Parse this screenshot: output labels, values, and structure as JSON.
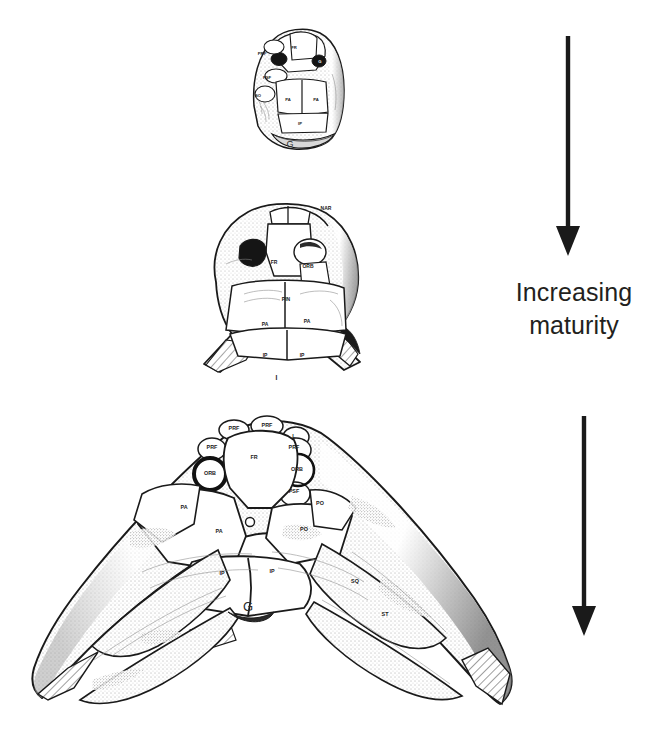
{
  "figure": {
    "background_color": "#ffffff",
    "ink_color": "#231f20",
    "line_color": "#1a1a1a"
  },
  "caption": {
    "line1": "Increasing",
    "line2": "maturity",
    "color": "#231f20"
  },
  "arrows": [
    {
      "name": "upper-arrow",
      "direction": "down",
      "color": "#1a1a1a"
    },
    {
      "name": "lower-arrow",
      "direction": "down",
      "color": "#1a1a1a"
    }
  ],
  "specimens": [
    {
      "id": "juvenile",
      "stage": "juvenile",
      "order": 1,
      "outline_labels": [
        "G"
      ],
      "plate_labels": [
        "PRF",
        "FR",
        "G",
        "PSF",
        "SO",
        "PA",
        "PA",
        "IP"
      ],
      "labels": [
        {
          "text": "PRF",
          "x": 30,
          "y": 40
        },
        {
          "text": "FR",
          "x": 62,
          "y": 34
        },
        {
          "text": "G",
          "x": 88,
          "y": 48
        },
        {
          "text": "PSF",
          "x": 35,
          "y": 64
        },
        {
          "text": "SO",
          "x": 26,
          "y": 82
        },
        {
          "text": "PA",
          "x": 56,
          "y": 86
        },
        {
          "text": "PA",
          "x": 84,
          "y": 86
        },
        {
          "text": "IP",
          "x": 68,
          "y": 110
        },
        {
          "text": "G",
          "x": 58,
          "y": 131
        }
      ]
    },
    {
      "id": "subadult",
      "stage": "sub-adult",
      "order": 2,
      "plate_labels": [
        "NAR",
        "FR",
        "ORB",
        "PIN",
        "PA",
        "PA",
        "IP",
        "IP",
        "L"
      ],
      "labels": [
        {
          "text": "NAR",
          "x": 166,
          "y": 19
        },
        {
          "text": "FR",
          "x": 114,
          "y": 73
        },
        {
          "text": "ORB",
          "x": 148,
          "y": 77
        },
        {
          "text": "PIN",
          "x": 126,
          "y": 110
        },
        {
          "text": "PA",
          "x": 105,
          "y": 135
        },
        {
          "text": "PA",
          "x": 147,
          "y": 132
        },
        {
          "text": "IP",
          "x": 105,
          "y": 166
        },
        {
          "text": "IP",
          "x": 142,
          "y": 166
        },
        {
          "text": "L",
          "x": 118,
          "y": 190
        }
      ]
    },
    {
      "id": "mature",
      "stage": "mature",
      "order": 3,
      "plate_labels": [
        "PRF",
        "PRF",
        "L",
        "FR",
        "PRF",
        "ORB",
        "ORB",
        "PSF",
        "PA",
        "PA",
        "PO",
        "PO",
        "IP",
        "IP",
        "SQ",
        "ST",
        "G"
      ],
      "labels": [
        {
          "text": "PRF",
          "x": 212,
          "y": 17
        },
        {
          "text": "PRF",
          "x": 245,
          "y": 14
        },
        {
          "text": "L",
          "x": 272,
          "y": 25
        },
        {
          "text": "PRF",
          "x": 190,
          "y": 36
        },
        {
          "text": "FR",
          "x": 232,
          "y": 46
        },
        {
          "text": "PRF",
          "x": 272,
          "y": 36
        },
        {
          "text": "ORB",
          "x": 188,
          "y": 62
        },
        {
          "text": "ORB",
          "x": 275,
          "y": 58
        },
        {
          "text": "PSF",
          "x": 272,
          "y": 80
        },
        {
          "text": "PA",
          "x": 162,
          "y": 96
        },
        {
          "text": "PO",
          "x": 298,
          "y": 92
        },
        {
          "text": "PA",
          "x": 197,
          "y": 120
        },
        {
          "text": "PO",
          "x": 282,
          "y": 118
        },
        {
          "text": "IP",
          "x": 200,
          "y": 162
        },
        {
          "text": "IP",
          "x": 250,
          "y": 160
        },
        {
          "text": "SQ",
          "x": 333,
          "y": 170
        },
        {
          "text": "ST",
          "x": 363,
          "y": 203
        },
        {
          "text": "G",
          "x": 226,
          "y": 196
        }
      ]
    }
  ]
}
